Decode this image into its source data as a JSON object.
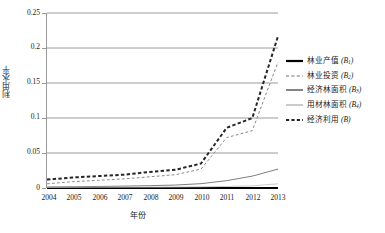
{
  "chart_data": {
    "type": "line",
    "title": "",
    "xlabel": "年份",
    "ylabel": "利用水平",
    "x": [
      2004,
      2005,
      2006,
      2007,
      2008,
      2009,
      2010,
      2011,
      2012,
      2013
    ],
    "categories": [
      "2004",
      "2005",
      "2006",
      "2007",
      "2008",
      "2009",
      "2010",
      "2011",
      "2012",
      "2013"
    ],
    "ylim": [
      0,
      0.25
    ],
    "yticks": [
      0,
      0.05,
      0.1,
      0.15,
      0.2,
      0.25
    ],
    "ytick_labels": [
      "0",
      "0.05",
      "0.1",
      "0.15",
      "0.2",
      "0.25"
    ],
    "grid": "horizontal",
    "legend_position": "right",
    "series": [
      {
        "name": "林业产值",
        "symbol": "B",
        "subscript": "1",
        "label": "林业产值 (B₁)",
        "style": "solid",
        "width": 2.2,
        "color": "#000000",
        "values": [
          0.0,
          0.0,
          0.0,
          0.0,
          0.0,
          0.0,
          0.0,
          0.0,
          0.0,
          0.0
        ]
      },
      {
        "name": "林业投资",
        "symbol": "B",
        "subscript": "2",
        "label": "林业投资 (B₂)",
        "style": "dashed",
        "width": 1.0,
        "color": "#8a8a8a",
        "values": [
          0.006,
          0.009,
          0.011,
          0.013,
          0.016,
          0.019,
          0.027,
          0.072,
          0.082,
          0.18
        ]
      },
      {
        "name": "经济林面积",
        "symbol": "B",
        "subscript": "3",
        "label": "经济林面积 (B₃)",
        "style": "solid",
        "width": 0.9,
        "color": "#6e6e6e",
        "values": [
          0.0015,
          0.0018,
          0.0022,
          0.0027,
          0.0033,
          0.0042,
          0.0062,
          0.0105,
          0.017,
          0.027
        ]
      },
      {
        "name": "用材林面积",
        "symbol": "B",
        "subscript": "4",
        "label": "用材林面积 (B₄)",
        "style": "solid",
        "width": 0.8,
        "color": "#bdbdbd",
        "values": [
          0.0008,
          0.0009,
          0.001,
          0.0011,
          0.0012,
          0.0014,
          0.0017,
          0.0022,
          0.0031,
          0.006
        ]
      },
      {
        "name": "经济利用",
        "symbol": "B",
        "subscript": "",
        "label": "经济利用 (B)",
        "style": "dashed",
        "width": 2.0,
        "color": "#262626",
        "values": [
          0.012,
          0.015,
          0.017,
          0.019,
          0.023,
          0.026,
          0.035,
          0.086,
          0.1,
          0.217
        ]
      }
    ]
  },
  "axes": {
    "y_title": "利用水平",
    "x_title": "年份"
  }
}
